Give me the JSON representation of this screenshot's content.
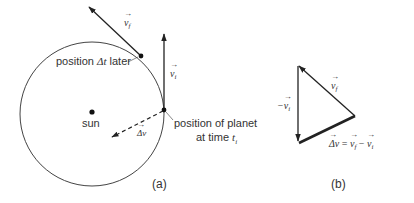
{
  "figure": {
    "panel_a": {
      "caption": "(a)",
      "sun_label": "sun",
      "later_position_label_prefix": "position ",
      "later_position_label_delta": "Δt",
      "later_position_label_suffix": " later",
      "planet_position_label_line1": "position of planet",
      "planet_position_label_line2_prefix": "at time ",
      "planet_position_label_line2_var": "t",
      "planet_position_label_line2_sub": "i",
      "vector_vf_label": {
        "symbol": "v",
        "sub": "f"
      },
      "vector_vi_label": {
        "symbol": "v",
        "sub": "i"
      },
      "vector_dv_label": {
        "symbol": "Δv",
        "sub": ""
      }
    },
    "panel_b": {
      "caption": "(b)",
      "vector_vf_label": {
        "symbol": "v",
        "sub": "f"
      },
      "vector_neg_vi_label": {
        "prefix": "−",
        "symbol": "v",
        "sub": "i"
      },
      "equation": {
        "lhs": "Δv",
        "eq": " = ",
        "term1": "v",
        "term1_sub": "f",
        "minus": " − ",
        "term2": "v",
        "term2_sub": "i"
      }
    },
    "colors": {
      "line": "#333333",
      "background": "#ffffff"
    }
  }
}
